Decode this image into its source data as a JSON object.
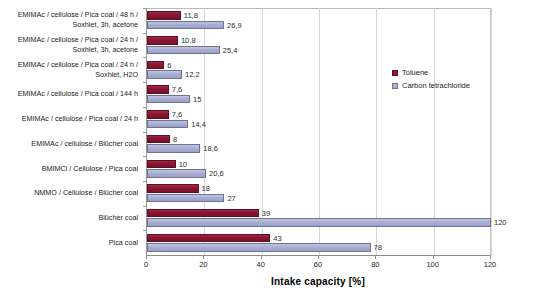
{
  "chart_data": {
    "type": "bar",
    "orientation": "horizontal",
    "title": "",
    "xlabel": "Intake capacity [%]",
    "ylabel": "",
    "xlim": [
      0,
      120
    ],
    "xticks": [
      0,
      20,
      40,
      60,
      80,
      100,
      120
    ],
    "grid": true,
    "legend_position": "right-top",
    "categories": [
      "EMIMAc / cellulose / Pica coal / 48 h /\nSoxhlet, 3h, acetone",
      "EMIMAc / cellulose / Pica coal / 24 h /\nSoxhlet, 3h, acetone",
      "EMIMAc / cellulose / Pica coal / 24 h /\nSoxhlet, H2O",
      "EMIMAc / cellulose / Pica coal / 144 h",
      "EMIMAc / cellulose / Pica coal / 24 h",
      "EMIMAc / cellulose / Blücher coal",
      "BMIMCl / Cellulose / Pica coal",
      "NMMO / Cellulose / Blücher coal",
      "Blücher coal",
      "Pica coal"
    ],
    "series": [
      {
        "name": "Toluene",
        "color": "#8b1733",
        "values": [
          11.8,
          10.8,
          6,
          7.6,
          7.6,
          8,
          10,
          18,
          39,
          43
        ],
        "labels": [
          "11,8",
          "10,8",
          "6",
          "7,6",
          "7,6",
          "8",
          "10",
          "18",
          "39",
          "43"
        ]
      },
      {
        "name": "Carbon tetrachloride",
        "color": "#a9afd2",
        "values": [
          26.9,
          25.4,
          12.2,
          15,
          14.4,
          18.6,
          20.6,
          27,
          120,
          78
        ],
        "labels": [
          "26,9",
          "25,4",
          "12,2",
          "15",
          "14,4",
          "18,6",
          "20,6",
          "27",
          "120",
          "78"
        ]
      }
    ]
  },
  "legend": {
    "items": [
      {
        "label": "Toluene",
        "swatch": "toluene"
      },
      {
        "label": "Carbon tetrachloride",
        "swatch": "ccl4"
      }
    ]
  }
}
